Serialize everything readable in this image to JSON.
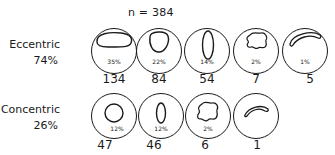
{
  "header": {
    "n_label": "n = 384"
  },
  "groups": [
    {
      "name": "Eccentric",
      "percent": "74%",
      "items": [
        {
          "shape": "wide-oval-icon",
          "percent": "35%",
          "count": "134"
        },
        {
          "shape": "round-oval-icon",
          "percent": "22%",
          "count": "84"
        },
        {
          "shape": "tall-oval-icon",
          "percent": "14%",
          "count": "54"
        },
        {
          "shape": "irregular-blob-icon",
          "percent": "2%",
          "count": "7"
        },
        {
          "shape": "crescent-icon",
          "percent": "1%",
          "count": "5"
        }
      ]
    },
    {
      "name": "Concentric",
      "percent": "26%",
      "items": [
        {
          "shape": "circle-icon",
          "percent": "12%",
          "count": "47"
        },
        {
          "shape": "tall-oval-icon",
          "percent": "12%",
          "count": "46"
        },
        {
          "shape": "irregular-blob-icon",
          "percent": "2%",
          "count": "6"
        },
        {
          "shape": "crescent-icon",
          "percent": "",
          "count": "1"
        }
      ]
    }
  ],
  "colors": {
    "stroke": "#1a1a1a",
    "background": "#ffffff"
  }
}
